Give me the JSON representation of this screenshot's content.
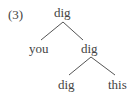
{
  "example_number": "(3)",
  "tree": {
    "root": {
      "label": "dig"
    },
    "left_child": {
      "label": "you"
    },
    "right_child": {
      "label": "dig"
    },
    "right_left": {
      "label": "dig"
    },
    "right_right": {
      "label": "this"
    }
  },
  "colors": {
    "text": "#444444",
    "lines": "#555555"
  }
}
